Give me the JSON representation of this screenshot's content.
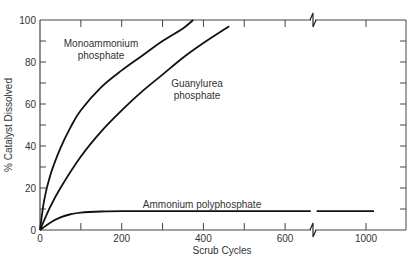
{
  "chart_data": {
    "type": "line",
    "title": "",
    "xlabel": "Scrub Cycles",
    "ylabel": "% Catalyst Dissolved",
    "xlim": [
      0,
      1080
    ],
    "ylim": [
      0,
      100
    ],
    "x_axis_break": 670,
    "x_ticks": [
      0,
      100,
      200,
      300,
      400,
      500,
      600,
      1000
    ],
    "x_tick_labels": [
      "0",
      "200",
      "400",
      "600",
      "1000"
    ],
    "y_ticks": [
      0,
      10,
      20,
      30,
      40,
      50,
      60,
      70,
      80,
      90,
      100
    ],
    "y_tick_labels": [
      "0",
      "20",
      "40",
      "60",
      "80",
      "100"
    ],
    "grid": false,
    "legend": "inline labels",
    "series": [
      {
        "name": "Monoammonium phosphate",
        "label_lines": [
          "Monoammonium",
          "phosphate"
        ],
        "x": [
          0,
          10,
          25,
          50,
          75,
          100,
          150,
          200,
          250,
          300,
          350,
          375
        ],
        "y": [
          0,
          14,
          26,
          39,
          49,
          57,
          68,
          76,
          83,
          90,
          96,
          100
        ]
      },
      {
        "name": "Guanylurea phosphate",
        "label_lines": [
          "Guanylurea",
          "phosphate"
        ],
        "x": [
          0,
          25,
          50,
          100,
          150,
          200,
          250,
          300,
          350,
          400,
          463
        ],
        "y": [
          0,
          11,
          20,
          35,
          47,
          57,
          66,
          74,
          82,
          89,
          97
        ]
      },
      {
        "name": "Ammonium polyphosphate",
        "label_lines": [
          "Ammonium polyphosphate"
        ],
        "x": [
          0,
          25,
          50,
          75,
          100,
          150,
          200,
          400,
          600,
          670,
          1050
        ],
        "y": [
          0,
          3.5,
          6,
          7.5,
          8.3,
          8.8,
          9,
          9,
          9,
          9,
          9
        ]
      }
    ]
  }
}
